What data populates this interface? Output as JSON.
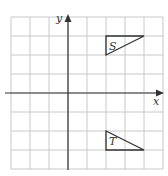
{
  "diagram": {
    "type": "coordinate-grid",
    "grid": {
      "x_min": -3,
      "x_max": 5,
      "y_min": -4,
      "y_max": 4,
      "cell_px": 19,
      "origin_px": [
        68,
        93
      ],
      "left_px": 11,
      "top_px": 16
    },
    "axes": {
      "x_label": "x",
      "y_label": "y"
    },
    "shapes": [
      {
        "name": "S",
        "label": "S",
        "vertices": [
          [
            2,
            3
          ],
          [
            4,
            3
          ],
          [
            2,
            2
          ]
        ]
      },
      {
        "name": "T",
        "label": "T",
        "vertices": [
          [
            2,
            -2
          ],
          [
            2,
            -3
          ],
          [
            4,
            -3
          ]
        ]
      }
    ],
    "colors": {
      "grid": "#c8c8c8",
      "axis": "#333333",
      "shape": "#333333",
      "background": "#ffffff"
    }
  }
}
